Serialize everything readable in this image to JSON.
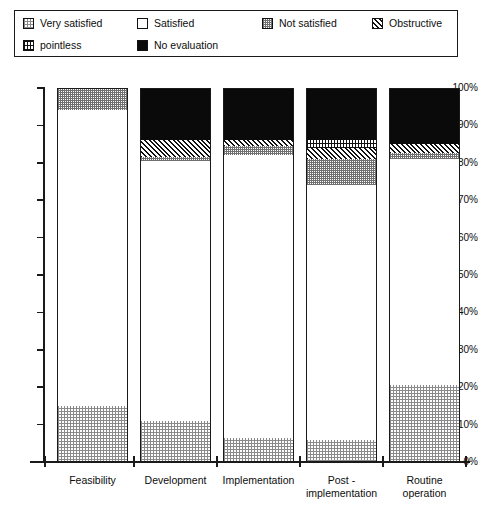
{
  "legend": {
    "items": [
      {
        "label": "Very satisfied",
        "key": "very_satisfied",
        "swatch": "dotted-gray-swatch"
      },
      {
        "label": "Satisfied",
        "key": "satisfied",
        "swatch": "white-swatch"
      },
      {
        "label": "Not satisfied",
        "key": "not_satisfied",
        "swatch": "fine-dotted-swatch"
      },
      {
        "label": "Obstructive",
        "key": "obstructive",
        "swatch": "diagonal-hatch-swatch"
      },
      {
        "label": "pointless",
        "key": "pointless",
        "swatch": "grid-hatch-swatch"
      },
      {
        "label": "No evaluation",
        "key": "no_evaluation",
        "swatch": "black-swatch"
      }
    ]
  },
  "chart_data": {
    "type": "bar",
    "stacked": true,
    "title": "",
    "xlabel": "",
    "ylabel": "",
    "ylim": [
      0,
      100
    ],
    "grid": false,
    "legend_position": "top",
    "categories": [
      "Feasibility",
      "Development",
      "Implementation",
      "Post - implementation",
      "Routine operation"
    ],
    "category_lines": [
      [
        "Feasibility"
      ],
      [
        "Development"
      ],
      [
        "Implementation"
      ],
      [
        "Post -",
        "implementation"
      ],
      [
        "Routine",
        "operation"
      ]
    ],
    "ytick_labels": [
      "0%",
      "10%",
      "20%",
      "30%",
      "40%",
      "50%",
      "60%",
      "70%",
      "80%",
      "90%",
      "100%"
    ],
    "ytick_values": [
      0,
      10,
      20,
      30,
      40,
      50,
      60,
      70,
      80,
      90,
      100
    ],
    "series": [
      {
        "name": "Very satisfied",
        "key": "very_satisfied",
        "values": [
          15,
          11,
          6.5,
          6,
          20.5
        ]
      },
      {
        "name": "Satisfied",
        "key": "satisfied",
        "values": [
          79,
          69.5,
          75.5,
          68,
          60.5
        ]
      },
      {
        "name": "Not satisfied",
        "key": "not_satisfied",
        "values": [
          6,
          1,
          2.5,
          7,
          1.5
        ]
      },
      {
        "name": "Obstructive",
        "key": "obstructive",
        "values": [
          0,
          4.5,
          1.5,
          3,
          2.5
        ]
      },
      {
        "name": "pointless",
        "key": "pointless",
        "values": [
          0,
          0,
          0,
          2,
          0
        ]
      },
      {
        "name": "No evaluation",
        "key": "no_evaluation",
        "values": [
          0,
          14,
          14,
          14,
          15
        ]
      }
    ]
  }
}
